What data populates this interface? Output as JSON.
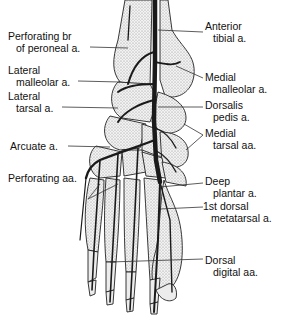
{
  "diagram": {
    "colors": {
      "background": "#ffffff",
      "bone_fill": "#e4e4e4",
      "outline": "#222222",
      "artery": "#1a1a1a",
      "leader": "#333333"
    },
    "labels": {
      "perforating_br_peroneal": {
        "line1": "Perforating br",
        "line2": "of peroneal a."
      },
      "lateral_malleolar": {
        "line1": "Lateral",
        "line2": "malleolar a."
      },
      "lateral_tarsal": {
        "line1": "Lateral",
        "line2": "tarsal a."
      },
      "arcuate": {
        "line1": "Arcuate a."
      },
      "perforating_aa": {
        "line1": "Perforating aa."
      },
      "anterior_tibial": {
        "line1": "Anterior",
        "line2": "tibial a."
      },
      "medial_malleolar": {
        "line1": "Medial",
        "line2": "malleolar a."
      },
      "dorsalis_pedis": {
        "line1": "Dorsalis",
        "line2": "pedis a."
      },
      "medial_tarsal": {
        "line1": "Medial",
        "line2": "tarsal aa."
      },
      "deep_plantar": {
        "line1": "Deep",
        "line2": "plantar a."
      },
      "first_dorsal_metatarsal": {
        "line1": "1st dorsal",
        "line2": "metatarsal a."
      },
      "dorsal_digital": {
        "line1": "Dorsal",
        "line2": "digital aa."
      }
    }
  }
}
